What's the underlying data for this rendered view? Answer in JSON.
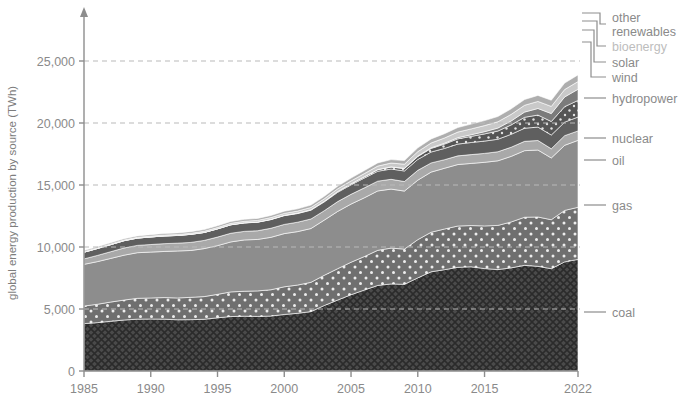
{
  "chart_data": {
    "type": "area",
    "title": "",
    "subtitle": "",
    "xlabel": "",
    "ylabel": "global energy production by source (TWh)",
    "xlim": [
      1985,
      2022
    ],
    "ylim": [
      0,
      28000
    ],
    "grid": true,
    "legend_position": "right-outside",
    "stacked": true,
    "x_ticks": [
      "1985",
      "1990",
      "1995",
      "2000",
      "2005",
      "2010",
      "2015",
      "2022"
    ],
    "x_tick_values": [
      1985,
      1990,
      1995,
      2000,
      2005,
      2010,
      2015,
      2022
    ],
    "y_ticks": [
      "0",
      "5,000",
      "10,000",
      "15,000",
      "20,000",
      "25,000"
    ],
    "y_tick_values": [
      0,
      5000,
      10000,
      15000,
      20000,
      25000
    ],
    "x": [
      1985,
      1986,
      1987,
      1988,
      1989,
      1990,
      1991,
      1992,
      1993,
      1994,
      1995,
      1996,
      1997,
      1998,
      1999,
      2000,
      2001,
      2002,
      2003,
      2004,
      2005,
      2006,
      2007,
      2008,
      2009,
      2010,
      2011,
      2012,
      2013,
      2014,
      2015,
      2016,
      2017,
      2018,
      2019,
      2020,
      2021,
      2022
    ],
    "series": [
      {
        "name": "coal",
        "color": "#4a4a4a",
        "pattern": "crosshatch",
        "values": [
          3820,
          3900,
          4010,
          4110,
          4180,
          4190,
          4180,
          4130,
          4140,
          4170,
          4290,
          4390,
          4420,
          4400,
          4430,
          4560,
          4650,
          4790,
          5280,
          5720,
          6150,
          6530,
          6900,
          7020,
          6990,
          7510,
          8000,
          8170,
          8360,
          8400,
          8260,
          8180,
          8320,
          8520,
          8440,
          8250,
          8800,
          9000
        ]
      },
      {
        "name": "gas",
        "color": "#6f6f6f",
        "pattern": "dots",
        "values": [
          1420,
          1480,
          1550,
          1610,
          1680,
          1700,
          1740,
          1760,
          1800,
          1830,
          1890,
          1990,
          2010,
          2060,
          2120,
          2230,
          2280,
          2360,
          2440,
          2530,
          2620,
          2700,
          2830,
          2890,
          2840,
          3080,
          3190,
          3280,
          3330,
          3330,
          3440,
          3560,
          3700,
          3880,
          3980,
          3950,
          4150,
          4200
        ]
      },
      {
        "name": "oil",
        "color": "#8d8d8d",
        "pattern": "solid",
        "values": [
          3360,
          3440,
          3520,
          3620,
          3680,
          3700,
          3720,
          3790,
          3780,
          3870,
          3930,
          4030,
          4140,
          4150,
          4230,
          4290,
          4310,
          4340,
          4450,
          4620,
          4690,
          4740,
          4790,
          4760,
          4680,
          4800,
          4850,
          4900,
          4960,
          5010,
          5130,
          5210,
          5290,
          5370,
          5400,
          4980,
          5250,
          5400
        ]
      },
      {
        "name": "nuclear",
        "color": "#a9a9a9",
        "pattern": "solid",
        "values": [
          440,
          500,
          540,
          580,
          590,
          610,
          630,
          630,
          650,
          660,
          690,
          700,
          690,
          700,
          730,
          740,
          760,
          770,
          760,
          790,
          790,
          800,
          790,
          790,
          770,
          790,
          740,
          690,
          700,
          710,
          720,
          730,
          740,
          750,
          770,
          740,
          780,
          760
        ]
      },
      {
        "name": "hydropower",
        "color": "#5f5f5f",
        "pattern": "solid",
        "values": [
          540,
          560,
          570,
          590,
          590,
          610,
          620,
          620,
          650,
          640,
          660,
          680,
          680,
          690,
          700,
          710,
          700,
          710,
          710,
          750,
          760,
          790,
          800,
          830,
          850,
          880,
          880,
          910,
          950,
          980,
          990,
          1010,
          1040,
          1060,
          1080,
          1110,
          1090,
          1120
        ]
      },
      {
        "name": "wind",
        "color": "#555555",
        "pattern": "dots",
        "values": [
          0,
          1,
          1,
          2,
          2,
          3,
          4,
          5,
          6,
          7,
          8,
          9,
          12,
          15,
          20,
          26,
          32,
          40,
          50,
          65,
          80,
          98,
          122,
          155,
          195,
          235,
          290,
          350,
          420,
          490,
          580,
          660,
          760,
          880,
          970,
          1090,
          1250,
          1340
        ]
      },
      {
        "name": "solar",
        "color": "#7b7b7b",
        "pattern": "solid",
        "values": [
          0,
          0,
          0,
          0,
          0,
          0,
          0,
          0,
          0,
          0,
          1,
          1,
          1,
          1,
          2,
          2,
          3,
          3,
          4,
          5,
          7,
          9,
          12,
          17,
          24,
          35,
          50,
          72,
          100,
          135,
          180,
          240,
          320,
          420,
          530,
          640,
          780,
          900
        ]
      },
      {
        "name": "bioenergy",
        "color": "#c9c9c9",
        "pattern": "solid",
        "values": [
          40,
          45,
          50,
          55,
          60,
          65,
          70,
          75,
          80,
          90,
          100,
          110,
          120,
          130,
          140,
          150,
          160,
          175,
          190,
          210,
          230,
          255,
          280,
          310,
          330,
          360,
          390,
          420,
          450,
          470,
          490,
          510,
          530,
          550,
          570,
          580,
          600,
          620
        ]
      },
      {
        "name": "other renewables",
        "color": "#aeaeae",
        "pattern": "solid",
        "values": [
          90,
          95,
          100,
          105,
          110,
          115,
          120,
          125,
          130,
          135,
          145,
          150,
          155,
          160,
          170,
          180,
          185,
          195,
          205,
          215,
          230,
          245,
          260,
          275,
          290,
          305,
          325,
          345,
          365,
          385,
          405,
          425,
          445,
          465,
          485,
          495,
          520,
          540
        ]
      }
    ],
    "totals_note": "stacked totals rise from about 9,700 TWh in 1985 to about 23,900 TWh in 2022"
  },
  "legend": {
    "items": [
      {
        "label_line1": "other",
        "label_line2": "renewables",
        "key": "other-renewables",
        "dim": false
      },
      {
        "label_line1": "bioenergy",
        "label_line2": "",
        "key": "bioenergy",
        "dim": true
      },
      {
        "label_line1": "solar",
        "label_line2": "",
        "key": "solar",
        "dim": false
      },
      {
        "label_line1": "wind",
        "label_line2": "",
        "key": "wind",
        "dim": false
      },
      {
        "label_line1": "hydropower",
        "label_line2": "",
        "key": "hydropower",
        "dim": false
      },
      {
        "label_line1": "nuclear",
        "label_line2": "",
        "key": "nuclear",
        "dim": false
      },
      {
        "label_line1": "oil",
        "label_line2": "",
        "key": "oil",
        "dim": false
      },
      {
        "label_line1": "gas",
        "label_line2": "",
        "key": "gas",
        "dim": false
      },
      {
        "label_line1": "coal",
        "label_line2": "",
        "key": "coal",
        "dim": false
      }
    ]
  },
  "colors": {
    "background": "#ffffff",
    "axis": "#8d8d8d",
    "gridline": "#b9b9b9",
    "text": "#8a8a8a"
  }
}
